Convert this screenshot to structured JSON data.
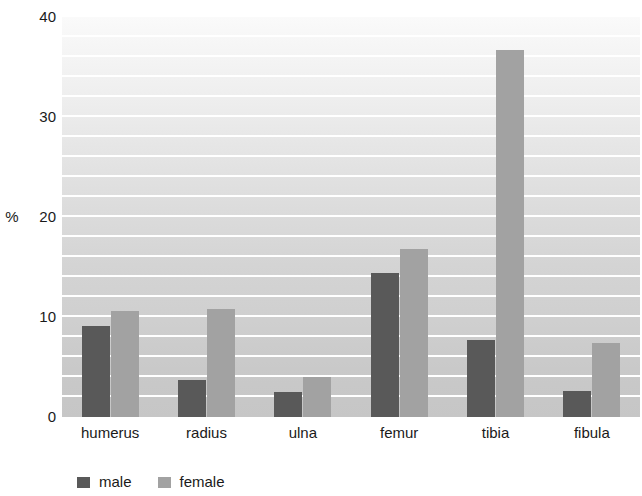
{
  "chart_data": {
    "type": "bar",
    "title": "",
    "subtitle": "",
    "xlabel": "",
    "ylabel": "%",
    "ylim": [
      0,
      40
    ],
    "yticks": [
      0,
      10,
      20,
      30,
      40
    ],
    "ytick_labels": [
      "0",
      "10",
      "20",
      "30",
      "40"
    ],
    "grid": true,
    "grid_step": 2,
    "grid_color": "#ffffff",
    "legend_position": "bottom-left",
    "categories": [
      "humerus",
      "radius",
      "ulna",
      "femur",
      "tibia",
      "fibula"
    ],
    "series": [
      {
        "name": "male",
        "color": "#595959",
        "values": [
          9.1,
          3.7,
          2.5,
          14.4,
          7.7,
          2.6
        ]
      },
      {
        "name": "female",
        "color": "#a2a2a2",
        "values": [
          10.6,
          10.8,
          4.0,
          16.8,
          36.7,
          7.4
        ]
      }
    ],
    "background": {
      "gradient_top": "#fafafa",
      "gradient_bottom": "#c6c6c6"
    }
  }
}
